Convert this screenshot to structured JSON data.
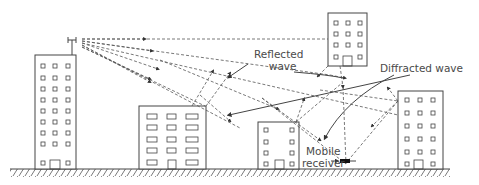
{
  "diagram": {
    "labels": {
      "reflected_line1": "Reflected",
      "reflected_line2": "wave",
      "diffracted": "Diffracted wave",
      "mobile_line1": "Mobile",
      "mobile_line2": "receiver"
    },
    "elements": {
      "transmitter": "base-station-antenna",
      "receiver": "mobile-receiver",
      "buildings": [
        "tall-left-tower",
        "low-wide-building",
        "small-building",
        "upper-right-building",
        "right-tower"
      ]
    },
    "colors": {
      "line": "#4a4a4a",
      "background": "#ffffff"
    }
  }
}
